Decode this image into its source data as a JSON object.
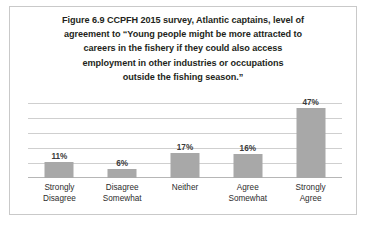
{
  "figure": {
    "title_lines": [
      "Figure 6.9 CCPFH 2015 survey, Atlantic captains, level of",
      "agreement to “Young people might be more attracted to",
      "careers in the fishery if they could also access",
      "employment in other industries or occupations",
      "outside the fishing season.”"
    ],
    "title_full": "Figure 6.9 CCPFH 2015 survey, Atlantic captains, level of agreement to “Young people might be more attracted to careers in the fishery if they could also access employment in other industries or occupations outside the fishing season.”",
    "border_color": "#c9c9c9",
    "bar_color": "#a8a8a8",
    "gridline_color": "#cfcfcf"
  },
  "chart_data": {
    "type": "bar",
    "categories": [
      "Strongly Disagree",
      "Disagree Somewhat",
      "Neither",
      "Agree Somewhat",
      "Strongly Agree"
    ],
    "category_lines": [
      [
        "Strongly",
        "Disagree"
      ],
      [
        "Disagree",
        "Somewhat"
      ],
      [
        "Neither"
      ],
      [
        "Agree",
        "Somewhat"
      ],
      [
        "Strongly",
        "Agree"
      ]
    ],
    "values": [
      11,
      6,
      17,
      16,
      47
    ],
    "data_labels": [
      "11%",
      "6%",
      "17%",
      "16%",
      "47%"
    ],
    "xlabel": "",
    "ylabel": "",
    "ylim": [
      0,
      50
    ],
    "yticks": [
      0,
      10,
      20,
      30,
      40,
      50
    ],
    "grid": true,
    "grid_axis": "y",
    "legend": false,
    "y_axis_labels_shown": false
  }
}
